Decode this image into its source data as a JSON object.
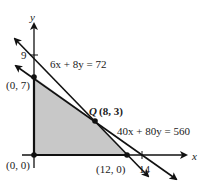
{
  "figure": {
    "axes": {
      "x_label": "x",
      "y_label": "y"
    },
    "ticks": {
      "y_tick": "9",
      "x_tick": "14"
    },
    "lines": [
      {
        "equation": "6x + 8y = 72",
        "x_intercept": 12,
        "y_intercept": 9
      },
      {
        "equation": "40x + 80y = 560",
        "x_intercept": 14,
        "y_intercept": 7
      }
    ],
    "points": {
      "origin": "(0, 0)",
      "p07": "(0, 7)",
      "p120": "(12, 0)",
      "q_name": "Q",
      "q_coords": "(8, 3)"
    },
    "feasible_region_vertices": [
      "(0, 0)",
      "(0, 7)",
      "(8, 3)",
      "(12, 0)"
    ],
    "colors": {
      "region_fill": "#c8c8c8",
      "line": "#111111"
    }
  }
}
